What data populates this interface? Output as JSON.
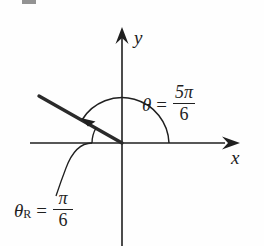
{
  "figure": {
    "type": "angle-diagram",
    "background_color": "#fefefe",
    "line_color": "#1f1f1f",
    "axes": {
      "x_label": "x",
      "y_label": "y",
      "origin": {
        "x": 122,
        "y": 143
      },
      "x_axis": {
        "x_start": 30,
        "x_end": 234,
        "y": 143,
        "arrow": "right"
      },
      "y_axis": {
        "x": 122,
        "y_start": 28,
        "y_end": 246,
        "arrow": "up"
      }
    },
    "terminal_ray": {
      "from": {
        "x": 122,
        "y": 143
      },
      "to": {
        "x": 39,
        "y": 97
      },
      "angle_degrees": 150
    },
    "main_angle": {
      "symbol": "θ",
      "subscript": "",
      "equals": "=",
      "numerator": "5π",
      "denominator": "6",
      "value_text": "θ = 5π/6",
      "radius": 47,
      "sweep": "counterclockwise from positive x-axis to terminal ray",
      "arrow_at": "terminal-ray-end"
    },
    "reference_angle": {
      "symbol": "θ",
      "subscript": "R",
      "equals": "=",
      "numerator": "π",
      "denominator": "6",
      "value_text": "θR = π/6",
      "radius": 30,
      "sweep": "from negative x-axis up to terminal ray",
      "leader_line": true
    }
  }
}
